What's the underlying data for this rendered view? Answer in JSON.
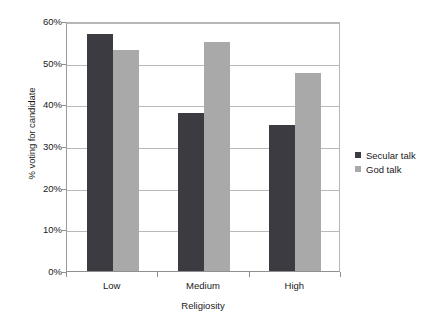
{
  "chart_data": {
    "type": "bar",
    "title": "",
    "xlabel": "Religiosity",
    "ylabel": "% voting for candidate",
    "categories": [
      "Low",
      "Medium",
      "High"
    ],
    "series": [
      {
        "name": "Secular talk",
        "color": "#3b3b41",
        "values": [
          57,
          38,
          35
        ]
      },
      {
        "name": "God talk",
        "color": "#a9a9a9",
        "values": [
          53,
          55,
          47.5
        ]
      }
    ],
    "ylim": [
      0,
      60
    ],
    "ytick_values": [
      0,
      10,
      20,
      30,
      40,
      50,
      60
    ],
    "ytick_labels": [
      "0%",
      "10%",
      "20%",
      "30%",
      "40%",
      "50%",
      "60%"
    ],
    "grid": true,
    "legend_position": "right"
  },
  "legend": {
    "items": [
      {
        "label": "Secular talk",
        "swatch": "secular"
      },
      {
        "label": "God talk",
        "swatch": "god"
      }
    ]
  }
}
